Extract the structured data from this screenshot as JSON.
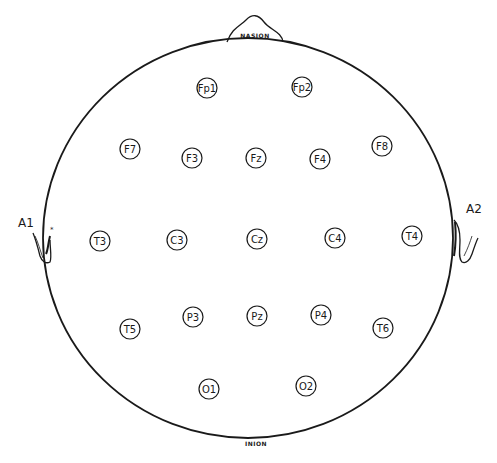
{
  "diagram": {
    "colors": {
      "ink": "#1a1a1a",
      "background": "#ffffff"
    },
    "landmarks": {
      "nasion": "NASION",
      "inion": "INION",
      "left_ear": "A1",
      "right_ear": "A2"
    },
    "electrodes": [
      {
        "label": "Fp1",
        "x": 207,
        "y": 88
      },
      {
        "label": "Fp2",
        "x": 302,
        "y": 87
      },
      {
        "label": "F7",
        "x": 130,
        "y": 149
      },
      {
        "label": "F3",
        "x": 192,
        "y": 158
      },
      {
        "label": "Fz",
        "x": 256,
        "y": 158
      },
      {
        "label": "F4",
        "x": 320,
        "y": 159
      },
      {
        "label": "F8",
        "x": 382,
        "y": 146
      },
      {
        "label": "T3",
        "x": 100,
        "y": 241
      },
      {
        "label": "C3",
        "x": 177,
        "y": 240
      },
      {
        "label": "Cz",
        "x": 257,
        "y": 239
      },
      {
        "label": "C4",
        "x": 335,
        "y": 238
      },
      {
        "label": "T4",
        "x": 412,
        "y": 236
      },
      {
        "label": "T5",
        "x": 130,
        "y": 329
      },
      {
        "label": "P3",
        "x": 193,
        "y": 317
      },
      {
        "label": "Pz",
        "x": 257,
        "y": 316
      },
      {
        "label": "P4",
        "x": 321,
        "y": 315
      },
      {
        "label": "T6",
        "x": 383,
        "y": 328
      },
      {
        "label": "O1",
        "x": 209,
        "y": 389
      },
      {
        "label": "O2",
        "x": 306,
        "y": 386
      }
    ]
  }
}
